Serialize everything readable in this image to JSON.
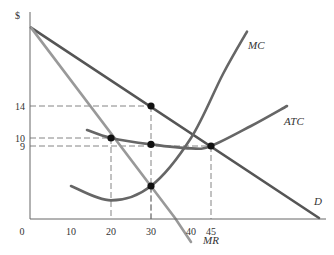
{
  "chart_data": {
    "type": "line",
    "title": "",
    "ylabel": "$",
    "xlabel": "",
    "xlim": [
      0,
      75
    ],
    "ylim": [
      0,
      26
    ],
    "x_ticks": [
      "0",
      "10",
      "20",
      "30",
      "40",
      "45"
    ],
    "x_tick_values": [
      0,
      10,
      20,
      30,
      40,
      45
    ],
    "y_ticks": [
      "14",
      "10",
      "9"
    ],
    "y_tick_values": [
      14,
      10,
      9
    ],
    "series": [
      {
        "name": "D",
        "points": [
          [
            0,
            23.8
          ],
          [
            72,
            0
          ]
        ],
        "color": "#555555"
      },
      {
        "name": "MR",
        "points": [
          [
            0,
            23.8
          ],
          [
            36,
            0
          ],
          [
            40,
            -3
          ]
        ],
        "color": "#999999"
      },
      {
        "name": "MC",
        "points": [
          [
            10,
            4
          ],
          [
            20,
            2.2
          ],
          [
            30,
            4
          ],
          [
            40,
            10
          ],
          [
            48,
            18
          ],
          [
            54,
            23.3
          ]
        ],
        "color": "#666666"
      },
      {
        "name": "ATC",
        "points": [
          [
            14,
            11
          ],
          [
            20,
            10
          ],
          [
            30,
            9.2
          ],
          [
            40,
            8.7
          ],
          [
            45,
            9
          ],
          [
            55,
            11.5
          ],
          [
            64,
            14
          ]
        ],
        "color": "#666666"
      }
    ],
    "points": [
      {
        "x": 30,
        "y": 14,
        "label": "P on D"
      },
      {
        "x": 20,
        "y": 10,
        "label": "ATC at 20"
      },
      {
        "x": 30,
        "y": 9.2,
        "label": "ATC at 30"
      },
      {
        "x": 45,
        "y": 9,
        "label": "ATC min / D"
      },
      {
        "x": 30,
        "y": 4,
        "label": "MC = MR"
      }
    ],
    "guides": [
      {
        "x": 30,
        "y": 14
      },
      {
        "x": 20,
        "y": 10
      },
      {
        "x": 45,
        "y": 9
      },
      {
        "x": 30,
        "y": 4
      }
    ],
    "curve_labels": {
      "MC": "MC",
      "ATC": "ATC",
      "D": "D",
      "MR": "MR"
    }
  }
}
